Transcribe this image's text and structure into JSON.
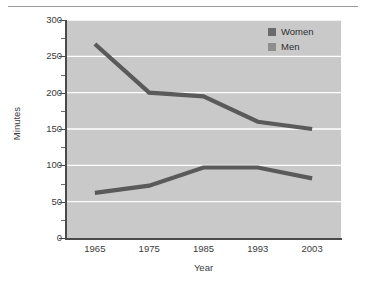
{
  "chart_data": {
    "type": "line",
    "title": "",
    "xlabel": "Year",
    "ylabel": "Minutes",
    "categories": [
      "1965",
      "1975",
      "1985",
      "1993",
      "2003"
    ],
    "series": [
      {
        "name": "Women",
        "values": [
          267,
          200,
          195,
          160,
          150
        ],
        "color": "#5a5a5a"
      },
      {
        "name": "Men",
        "values": [
          62,
          72,
          97,
          97,
          82
        ],
        "color": "#5a5a5a"
      }
    ],
    "ylim": [
      0,
      300
    ],
    "y_ticks": [
      "0",
      "50",
      "100",
      "150",
      "200",
      "250",
      "300"
    ],
    "y_tick_values": [
      0,
      50,
      100,
      150,
      200,
      250,
      300
    ],
    "y_minor_tick_values": [
      25,
      75,
      125,
      175,
      225,
      275
    ],
    "grid": "horizontal-white",
    "legend_position": "top-right",
    "plot_background": "#c9c9c9",
    "gridline_color": "#ffffff",
    "axis_color": "#4a4a4a"
  },
  "legend": {
    "entries": [
      {
        "label": "Women",
        "swatch_color": "#6b6b6b"
      },
      {
        "label": "Men",
        "swatch_color": "#8e8e8e"
      }
    ]
  },
  "axes": {
    "x_title": "Year",
    "y_title": "Minutes"
  }
}
